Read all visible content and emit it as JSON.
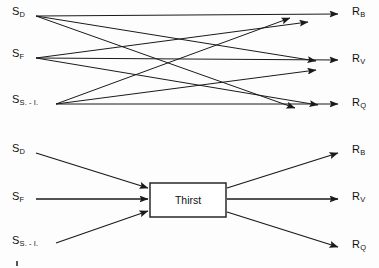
{
  "figure": {
    "background_color": "#fdfdfd",
    "stroke_color": "#1a1a1a",
    "diagrams": [
      {
        "id": "top",
        "name": "full-interconnection-diagram",
        "description": "Every stimulus connects directly to every response",
        "stimuli": [
          {
            "id": "S_D",
            "base": "S",
            "sub": "D",
            "x": 12,
            "y": 12
          },
          {
            "id": "S_F",
            "base": "S",
            "sub": "F",
            "x": 12,
            "y": 54
          },
          {
            "id": "S_S-I",
            "base": "S",
            "sub": "S. - I.",
            "x": 12,
            "y": 100
          }
        ],
        "responses": [
          {
            "id": "R_B",
            "base": "R",
            "sub": "B",
            "x": 355,
            "y": 12
          },
          {
            "id": "R_V",
            "base": "R",
            "sub": "V",
            "x": 355,
            "y": 61
          },
          {
            "id": "R_Q",
            "base": "R",
            "sub": "Q",
            "x": 355,
            "y": 110
          }
        ],
        "edge_count": 9
      },
      {
        "id": "bottom",
        "name": "mediating-construct-diagram",
        "description": "Stimuli converge on an intervening variable which fans out to responses",
        "stimuli": [
          {
            "id": "S_D",
            "base": "S",
            "sub": "D",
            "x": 12,
            "y": 13
          },
          {
            "id": "S_F",
            "base": "S",
            "sub": "F",
            "x": 12,
            "y": 55
          },
          {
            "id": "S_S-I",
            "base": "S",
            "sub": "S. - I.",
            "x": 12,
            "y": 103
          }
        ],
        "responses": [
          {
            "id": "R_B",
            "base": "R",
            "sub": "B",
            "x": 355,
            "y": 13
          },
          {
            "id": "R_V",
            "base": "R",
            "sub": "V",
            "x": 355,
            "y": 56
          },
          {
            "id": "R_Q",
            "base": "R",
            "sub": "Q",
            "x": 355,
            "y": 105
          }
        ],
        "mediator": {
          "label": "Thirst",
          "x": 150,
          "y": 48,
          "width": 76,
          "height": 34
        },
        "edge_count": 6
      }
    ]
  }
}
